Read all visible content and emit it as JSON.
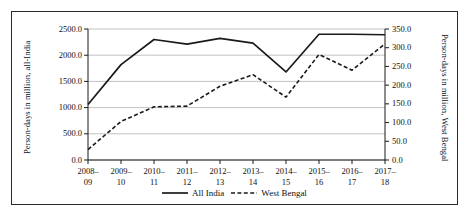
{
  "chart_data": {
    "type": "line",
    "title": "",
    "categories": [
      "2008–\n09",
      "2009–\n10",
      "2010–\n11",
      "2011–\n12",
      "2012–\n13",
      "2013–\n14",
      "2014–\n15",
      "2015–\n16",
      "2016–\n17",
      "2017–\n18"
    ],
    "categories_top": [
      "2008–",
      "2009–",
      "2010–",
      "2011–",
      "2012–",
      "2013–",
      "2014–",
      "2015–",
      "2016–",
      "2017–"
    ],
    "categories_bottom": [
      "09",
      "10",
      "11",
      "12",
      "13",
      "14",
      "15",
      "16",
      "17",
      "18"
    ],
    "series": [
      {
        "name": "All India",
        "axis": "left",
        "style": "solid",
        "color": "#1a1a1a",
        "values": [
          1060,
          1820,
          2300,
          2210,
          2320,
          2230,
          1680,
          2400,
          2400,
          2390
        ]
      },
      {
        "name": "West Bengal",
        "axis": "right",
        "style": "dashed",
        "color": "#1a1a1a",
        "values": [
          28,
          103,
          142,
          144,
          197,
          228,
          168,
          282,
          240,
          310
        ]
      }
    ],
    "xlabel": "",
    "ylabel": "Person-days in million, all-India",
    "ylabel_secondary": "Person-days in million, West Bengal",
    "ylim": [
      0,
      2500
    ],
    "ylim_secondary": [
      0,
      350
    ],
    "yticks": [
      "0.0",
      "500.0",
      "1000.0",
      "1500.0",
      "2000.0",
      "2500.0"
    ],
    "yticks_values": [
      0,
      500,
      1000,
      1500,
      2000,
      2500
    ],
    "yticks_secondary": [
      "0.0",
      "50.0",
      "100.0",
      "150.0",
      "200.0",
      "250.0",
      "300.0",
      "350.0"
    ],
    "yticks_secondary_values": [
      0,
      50,
      100,
      150,
      200,
      250,
      300,
      350
    ],
    "grid": true,
    "grid_color": "#b3b3b3",
    "legend_position": "bottom",
    "legend": [
      "All India",
      "West Bengal"
    ],
    "frame_color": "#2b2b2b",
    "background": "#ffffff"
  }
}
